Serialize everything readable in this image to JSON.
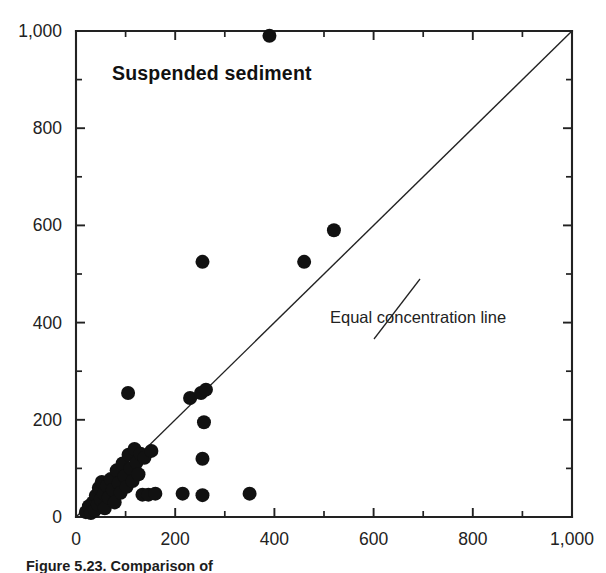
{
  "figure": {
    "title": "Suspended sediment",
    "caption": "Figure 5.23.  Comparison of",
    "background_color": "#ffffff",
    "ink_color": "#111111"
  },
  "chart_data": {
    "type": "scatter",
    "title": "Suspended sediment",
    "xlabel": "",
    "ylabel": "",
    "xlim": [
      0,
      1000
    ],
    "ylim": [
      0,
      1000
    ],
    "grid": false,
    "legend": "none",
    "x_ticks_major": [
      0,
      200,
      400,
      600,
      800,
      1000
    ],
    "x_tick_labels": [
      "0",
      "200",
      "400",
      "600",
      "800",
      "1,000"
    ],
    "y_ticks_major": [
      0,
      200,
      400,
      600,
      800,
      1000
    ],
    "y_tick_labels": [
      "0",
      "200",
      "400",
      "600",
      "800",
      "1,000"
    ],
    "x_ticks_minor": [
      100,
      300,
      500,
      700,
      900
    ],
    "y_ticks_minor": [
      100,
      300,
      500,
      700,
      900
    ],
    "marker": "filled-circle",
    "marker_color": "#111111",
    "marker_radius_px": 7,
    "series": [
      {
        "name": "Suspended sediment samples",
        "points": [
          [
            20,
            10
          ],
          [
            26,
            22
          ],
          [
            30,
            8
          ],
          [
            34,
            30
          ],
          [
            38,
            14
          ],
          [
            40,
            44
          ],
          [
            44,
            26
          ],
          [
            46,
            60
          ],
          [
            50,
            36
          ],
          [
            52,
            72
          ],
          [
            56,
            48
          ],
          [
            58,
            18
          ],
          [
            62,
            64
          ],
          [
            66,
            40
          ],
          [
            70,
            78
          ],
          [
            74,
            56
          ],
          [
            78,
            30
          ],
          [
            82,
            96
          ],
          [
            86,
            70
          ],
          [
            90,
            50
          ],
          [
            94,
            110
          ],
          [
            98,
            84
          ],
          [
            102,
            62
          ],
          [
            106,
            128
          ],
          [
            110,
            100
          ],
          [
            114,
            74
          ],
          [
            118,
            140
          ],
          [
            122,
            112
          ],
          [
            126,
            88
          ],
          [
            130,
            130
          ],
          [
            134,
            46
          ],
          [
            138,
            122
          ],
          [
            146,
            46
          ],
          [
            152,
            136
          ],
          [
            160,
            48
          ],
          [
            105,
            255
          ],
          [
            215,
            48
          ],
          [
            230,
            245
          ],
          [
            252,
            255
          ],
          [
            255,
            525
          ],
          [
            255,
            120
          ],
          [
            258,
            195
          ],
          [
            262,
            262
          ],
          [
            255,
            45
          ],
          [
            350,
            48
          ],
          [
            390,
            990
          ],
          [
            460,
            525
          ],
          [
            520,
            590
          ]
        ]
      }
    ],
    "reference_line": {
      "label": "Equal concentration line",
      "from": [
        0,
        0
      ],
      "to": [
        1000,
        1000
      ],
      "slope": 1,
      "intercept": 0
    },
    "annotations": [
      {
        "text": "Equal concentration line",
        "anchor_data": [
          600,
          560
        ],
        "text_data": [
          640,
          385
        ]
      }
    ]
  },
  "geometry": {
    "plot_left_px": 76,
    "plot_right_px": 572,
    "plot_top_px": 31,
    "plot_bottom_px": 517
  }
}
